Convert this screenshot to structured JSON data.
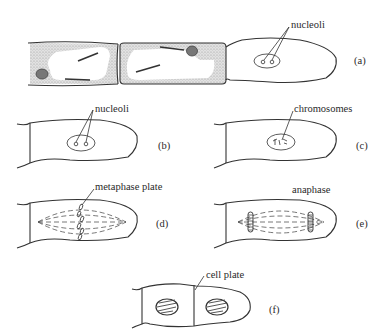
{
  "figure": {
    "panels": [
      {
        "id": "a",
        "tag": "(a)",
        "labels": [
          "nucleoli"
        ]
      },
      {
        "id": "b",
        "tag": "(b)",
        "labels": [
          "nucleoli"
        ]
      },
      {
        "id": "c",
        "tag": "(c)",
        "labels": [
          "chromosomes"
        ]
      },
      {
        "id": "d",
        "tag": "(d)",
        "labels": [
          "metaphase plate"
        ]
      },
      {
        "id": "e",
        "tag": "(e)",
        "labels": [
          "anaphase"
        ]
      },
      {
        "id": "f",
        "tag": "(f)",
        "labels": [
          "cell plate"
        ]
      }
    ]
  },
  "colors": {
    "ink": "#333333",
    "stipple": "#bdbdbd",
    "background": "#ffffff"
  }
}
